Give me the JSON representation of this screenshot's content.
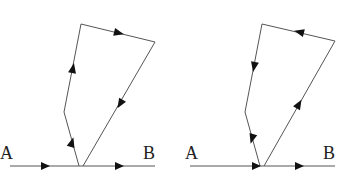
{
  "diagrams": [
    {
      "id": "left",
      "label_a": "A",
      "label_b": "B",
      "label_a_pos": [
        0,
        159
      ],
      "label_b_pos": [
        143,
        159
      ],
      "baseline": [
        [
          10,
          166
        ],
        [
          155,
          166
        ]
      ],
      "loop_path": [
        [
          79,
          166
        ],
        [
          64,
          112
        ],
        [
          81,
          24
        ],
        [
          155,
          42
        ],
        [
          83,
          166
        ]
      ],
      "arrows": [
        {
          "x": 46,
          "y": 166,
          "dir": "right"
        },
        {
          "x": 120,
          "y": 166,
          "dir": "right"
        },
        {
          "x": 72,
          "y": 142,
          "dir": "up-left-branch-lower"
        },
        {
          "x": 73,
          "y": 68,
          "dir": "up-left-branch-upper"
        },
        {
          "x": 120,
          "y": 32,
          "dir": "top-right"
        },
        {
          "x": 121,
          "y": 103,
          "dir": "down-right-edge"
        }
      ]
    },
    {
      "id": "right",
      "label_a": "A",
      "label_b": "B",
      "label_a_pos": [
        185,
        159
      ],
      "label_b_pos": [
        323,
        159
      ],
      "baseline": [
        [
          190,
          166
        ],
        [
          335,
          166
        ]
      ],
      "loop_path": [
        [
          260,
          166
        ],
        [
          245,
          112
        ],
        [
          262,
          24
        ],
        [
          335,
          41
        ],
        [
          264,
          166
        ]
      ],
      "arrows": [
        {
          "x": 256,
          "y": 166,
          "dir": "right"
        },
        {
          "x": 299,
          "y": 166,
          "dir": "right"
        },
        {
          "x": 252,
          "y": 138,
          "dir": "down-left-branch-lower"
        },
        {
          "x": 254,
          "y": 67,
          "dir": "down-left-branch-upper"
        },
        {
          "x": 300,
          "y": 32,
          "dir": "top-left"
        },
        {
          "x": 299,
          "y": 104,
          "dir": "up-right-edge"
        }
      ]
    }
  ]
}
